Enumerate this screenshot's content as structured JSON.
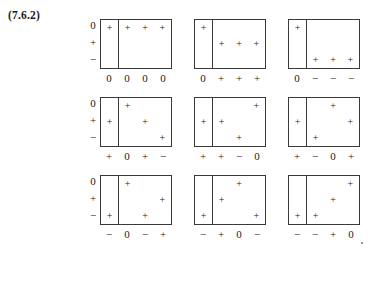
{
  "figure": {
    "equation_tag": "(7.6.2)",
    "row_axis_labels": [
      "0",
      "+",
      "−"
    ],
    "panels": [
      {
        "id": "panel-r1c1",
        "show_row_labels": true,
        "left_column_cells": [
          "+",
          "",
          ""
        ],
        "right_grid_rows": [
          [
            "+",
            "+",
            "+"
          ],
          [
            "",
            "",
            ""
          ],
          [
            "",
            "",
            ""
          ]
        ],
        "bottom_labels": {
          "left": "0",
          "right": [
            "0",
            "0",
            "0"
          ]
        }
      },
      {
        "id": "panel-r1c2",
        "show_row_labels": false,
        "left_column_cells": [
          "+",
          "",
          ""
        ],
        "right_grid_rows": [
          [
            "",
            "",
            ""
          ],
          [
            "+",
            "+",
            "+"
          ],
          [
            "",
            "",
            ""
          ]
        ],
        "bottom_labels": {
          "left": "0",
          "right": [
            "+",
            "+",
            "+"
          ]
        }
      },
      {
        "id": "panel-r1c3",
        "show_row_labels": false,
        "left_column_cells": [
          "+",
          "",
          ""
        ],
        "right_grid_rows": [
          [
            "",
            "",
            ""
          ],
          [
            "",
            "",
            ""
          ],
          [
            "+",
            "+",
            "+"
          ]
        ],
        "bottom_labels": {
          "left": "0",
          "right": [
            "−",
            "−",
            "−"
          ]
        }
      },
      {
        "id": "panel-r2c1",
        "show_row_labels": true,
        "left_column_cells": [
          "",
          "+",
          ""
        ],
        "right_grid_rows": [
          [
            "+",
            "",
            ""
          ],
          [
            "",
            "+",
            ""
          ],
          [
            "",
            "",
            "+"
          ]
        ],
        "bottom_labels": {
          "left": "+",
          "right": [
            "0",
            "+",
            "−"
          ]
        }
      },
      {
        "id": "panel-r2c2",
        "show_row_labels": false,
        "left_column_cells": [
          "",
          "+",
          ""
        ],
        "right_grid_rows": [
          [
            "",
            "",
            "+"
          ],
          [
            "+",
            "",
            ""
          ],
          [
            "",
            "+",
            ""
          ]
        ],
        "bottom_labels": {
          "left": "+",
          "right": [
            "+",
            "−",
            "0"
          ]
        }
      },
      {
        "id": "panel-r2c3",
        "show_row_labels": false,
        "left_column_cells": [
          "",
          "+",
          ""
        ],
        "right_grid_rows": [
          [
            "",
            "+",
            ""
          ],
          [
            "",
            "",
            "+"
          ],
          [
            "+",
            "",
            ""
          ]
        ],
        "bottom_labels": {
          "left": "+",
          "right": [
            "−",
            "0",
            "+"
          ]
        }
      },
      {
        "id": "panel-r3c1",
        "show_row_labels": true,
        "left_column_cells": [
          "",
          "",
          "+"
        ],
        "right_grid_rows": [
          [
            "+",
            "",
            ""
          ],
          [
            "",
            "",
            "+"
          ],
          [
            "",
            "+",
            ""
          ]
        ],
        "bottom_labels": {
          "left": "−",
          "right": [
            "0",
            "−",
            "+"
          ]
        }
      },
      {
        "id": "panel-r3c2",
        "show_row_labels": false,
        "left_column_cells": [
          "",
          "",
          "+"
        ],
        "right_grid_rows": [
          [
            "",
            "+",
            ""
          ],
          [
            "+",
            "",
            ""
          ],
          [
            "",
            "",
            "+"
          ]
        ],
        "bottom_labels": {
          "left": "−",
          "right": [
            "+",
            "0",
            "−"
          ]
        }
      },
      {
        "id": "panel-r3c3",
        "show_row_labels": false,
        "left_column_cells": [
          "",
          "",
          "+"
        ],
        "right_grid_rows": [
          [
            "",
            "",
            "+"
          ],
          [
            "",
            "+",
            ""
          ],
          [
            "+",
            "",
            ""
          ]
        ],
        "bottom_labels": {
          "left": "−",
          "right": [
            "−",
            "+",
            "0"
          ]
        }
      }
    ]
  }
}
